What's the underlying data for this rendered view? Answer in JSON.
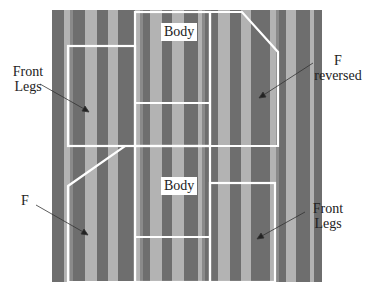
{
  "figure": {
    "type": "fabric-layout-diagram",
    "fabric": {
      "stripe_colors": [
        "#6e6e6e",
        "#b3b3b3",
        "#7a7a7a",
        "#a8a8a8"
      ],
      "outline_color": "#ffffff"
    },
    "pieces": [
      {
        "id": "body-top",
        "label": "Body"
      },
      {
        "id": "body-bottom",
        "label": "Body"
      }
    ],
    "callouts": [
      {
        "id": "front-legs-left",
        "line1": "Front",
        "line2": "Legs"
      },
      {
        "id": "f-reversed",
        "line1": "F",
        "line2": "reversed"
      },
      {
        "id": "f-left",
        "line1": "F"
      },
      {
        "id": "front-legs-right",
        "line1": "Front",
        "line2": "Legs"
      }
    ]
  }
}
